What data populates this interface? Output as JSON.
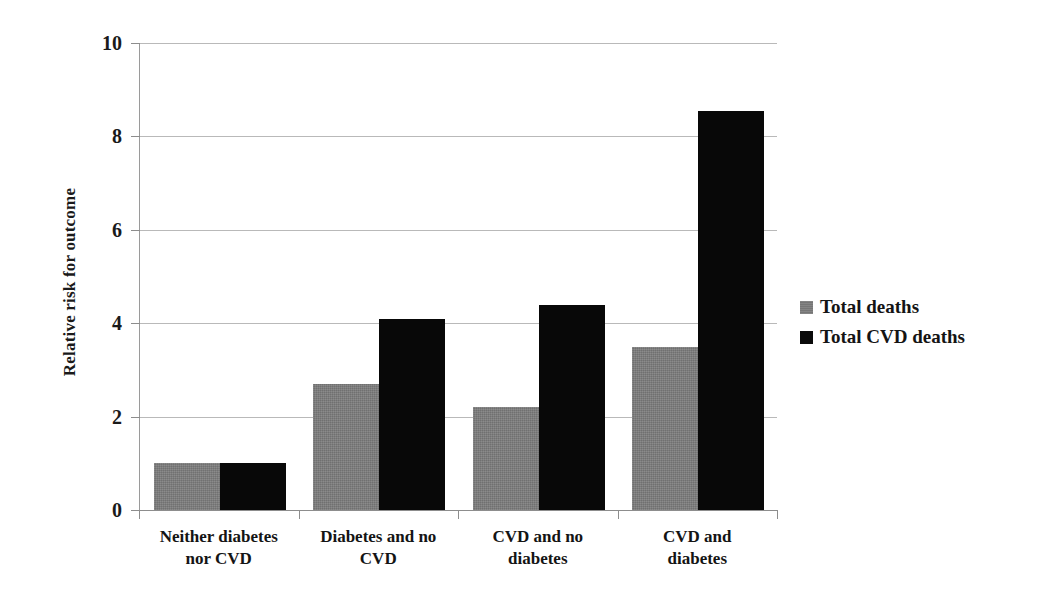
{
  "chart_data": {
    "type": "bar",
    "title": "",
    "xlabel": "",
    "ylabel": "Relative risk for outcome",
    "ylim": [
      0,
      10
    ],
    "yticks": [
      "0",
      "2",
      "4",
      "6",
      "8",
      "10"
    ],
    "grid": true,
    "legend_position": "right",
    "categories": [
      "Neither diabetes nor CVD",
      "Diabetes and no CVD",
      "CVD and no diabetes",
      "CVD and diabetes"
    ],
    "category_lines": [
      [
        "Neither diabetes",
        "nor CVD"
      ],
      [
        "Diabetes and no",
        "CVD"
      ],
      [
        "CVD and no",
        "diabetes"
      ],
      [
        "CVD and",
        "diabetes"
      ]
    ],
    "series": [
      {
        "name": "Total deaths",
        "color": "#7d7d7d",
        "values": [
          1.0,
          2.7,
          2.2,
          3.5
        ]
      },
      {
        "name": "Total CVD deaths",
        "color": "#080808",
        "values": [
          1.0,
          4.1,
          4.4,
          8.55
        ]
      }
    ]
  }
}
